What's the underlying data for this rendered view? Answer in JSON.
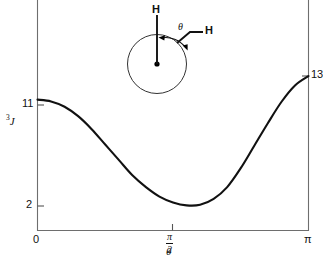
{
  "figure": {
    "kind": "karplus-curve",
    "background_color": "#ffffff",
    "axis_color": "#6e6e6e",
    "curve_color": "#111111"
  },
  "axes": {
    "y_label": "3J",
    "y_label_superscript": "3",
    "y_label_italic": "J",
    "x_label": "θ",
    "left_ticks": [
      "11",
      "2"
    ],
    "right_ticks": [
      "13"
    ],
    "x_ticks": [
      "0",
      "π/2",
      "π"
    ],
    "x_tick_pi_over_two_numerator": "π",
    "x_tick_pi_over_two_denominator": "2",
    "x_tick_zero": "0",
    "x_tick_pi": "π"
  },
  "molecule": {
    "name": "newman-projection",
    "front_atom_label": "H",
    "rear_atom_label": "H",
    "angle_label": "θ"
  },
  "chart_data": {
    "type": "line",
    "title": "",
    "xlabel": "θ",
    "ylabel": "3J",
    "xlim": [
      0,
      3.14159
    ],
    "ylim": [
      0,
      14
    ],
    "xtick_values": [
      0,
      1.5708,
      3.14159
    ],
    "xtick_labels": [
      "0",
      "π/2",
      "π"
    ],
    "ytick_values": [
      2,
      11,
      13
    ],
    "ytick_labels": [
      "2",
      "11",
      "13"
    ],
    "grid": false,
    "legend": null,
    "annotations": [
      {
        "text": "11",
        "x": 0,
        "y": 11
      },
      {
        "text": "2",
        "x": 1.65,
        "y": 2
      },
      {
        "text": "13",
        "x": 3.14159,
        "y": 13
      }
    ],
    "series": [
      {
        "name": "3J(θ)",
        "x": [
          0.0,
          0.157,
          0.314,
          0.471,
          0.628,
          0.785,
          0.942,
          1.1,
          1.257,
          1.414,
          1.571,
          1.728,
          1.885,
          2.042,
          2.199,
          2.356,
          2.513,
          2.67,
          2.827,
          2.985,
          3.142
        ],
        "y": [
          11.0,
          10.85,
          10.4,
          9.6,
          8.5,
          7.2,
          5.9,
          4.6,
          3.6,
          2.8,
          2.3,
          2.05,
          2.1,
          2.6,
          3.6,
          5.2,
          7.1,
          9.0,
          10.8,
          12.2,
          13.0
        ]
      }
    ]
  }
}
